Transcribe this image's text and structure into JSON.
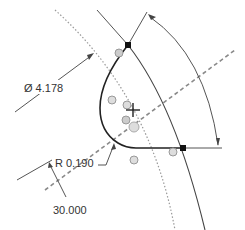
{
  "sketch": {
    "dimensions": {
      "diameter": {
        "symbol": "Ø",
        "value": "4.178",
        "label": "Ø 4.178"
      },
      "angle_top": {
        "value": "60.000",
        "label": "60.000"
      },
      "fillet_radius": {
        "prefix": "R",
        "value": "0.190",
        "label": "R 0.190"
      },
      "angle_bottom": {
        "value": "30.000",
        "label": "30.000"
      }
    },
    "colors": {
      "profile": "#222222",
      "construction": "#555555",
      "centerline": "#888888",
      "dotted_arc": "#999999",
      "constraint_glyph": "#aaaaaa",
      "vertex": "#111111"
    },
    "icons": [
      "origin-cross-icon",
      "vertex-point-icon",
      "constraint-glyph-icon"
    ]
  }
}
